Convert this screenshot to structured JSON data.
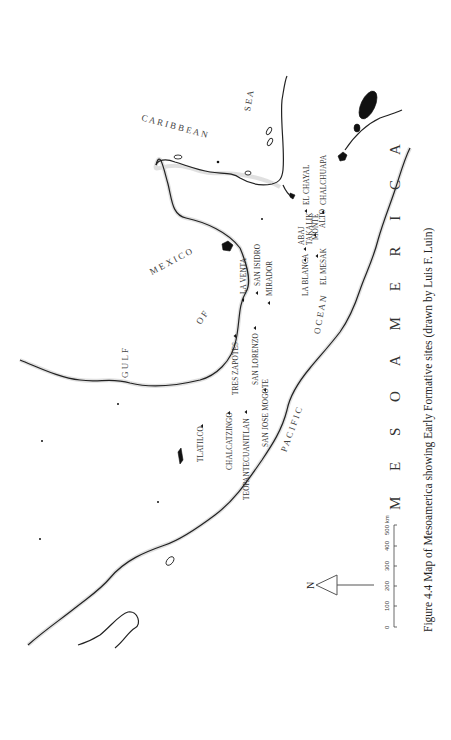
{
  "figure": {
    "caption": "Figure 4.4  Map of Mesoamerica showing Early Formative sites (drawn by Luis F. Luin)",
    "region_title": "M E S O A M E R I C A",
    "orientation": "rotated 90° counter-clockwise"
  },
  "water_bodies": {
    "gulf": "G U L F   O F   M E X I C O",
    "gulf_parts": [
      "G U L F",
      "O F",
      "M E X I C O"
    ],
    "caribbean": "C A R I B B E A N   S E A",
    "caribbean_parts": [
      "C A R I B B E A N",
      "S E A"
    ],
    "pacific": "P A C I F I C   O C E A N",
    "pacific_parts": [
      "P A C I F I C",
      "O C E A N"
    ]
  },
  "sites": [
    {
      "name": "TLATILCO"
    },
    {
      "name": "CHALCATZINGO"
    },
    {
      "name": "TEOPANTECUANITLAN"
    },
    {
      "name": "SAN JOSE MOGOTE"
    },
    {
      "name": "TRES ZAPOTES"
    },
    {
      "name": "SAN LORENZO"
    },
    {
      "name": "LA VENTA"
    },
    {
      "name": "SAN ISIDRO"
    },
    {
      "name": "MIRADOR"
    },
    {
      "name": "LA BLANCA"
    },
    {
      "name": "ABAJ"
    },
    {
      "name": "TAKALIK"
    },
    {
      "name": "EL MESAK"
    },
    {
      "name": "MONTE"
    },
    {
      "name": "ALTO"
    },
    {
      "name": "EL CHAYAL"
    },
    {
      "name": "CHALCHUAPA"
    }
  ],
  "north_arrow": {
    "label": "N"
  },
  "scale_bar": {
    "ticks": [
      "0",
      "100",
      "200",
      "300",
      "400",
      "500"
    ],
    "unit": "km",
    "last_label": "500 km"
  }
}
